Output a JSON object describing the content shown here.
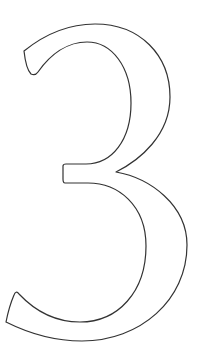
{
  "figure": {
    "glyph": "3",
    "style": "outline",
    "stroke_color": "#333333",
    "fill_color": "#ffffff",
    "background_color": "#ffffff"
  }
}
